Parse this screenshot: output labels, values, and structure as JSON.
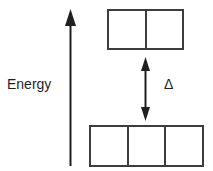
{
  "diagram": {
    "energy_axis_label": "Energy",
    "delta_label": "Δ",
    "upper_level": {
      "cells": 2
    },
    "lower_level": {
      "cells": 3
    },
    "colors": {
      "ink": "#1f1f1f",
      "box_stroke": "#3d3d3d",
      "background": "#ffffff"
    }
  }
}
